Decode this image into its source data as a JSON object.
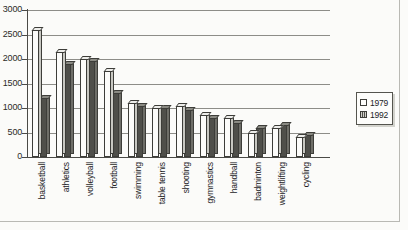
{
  "chart_data": {
    "type": "bar",
    "title": "",
    "xlabel": "",
    "ylabel": "",
    "ylim": [
      0,
      3000
    ],
    "ytick_values": [
      0,
      500,
      1000,
      1500,
      2000,
      2500,
      3000
    ],
    "ytick_labels": [
      "0",
      "500",
      "1000",
      "1500",
      "2000",
      "2500",
      "3000"
    ],
    "grid": true,
    "legend_position": "right",
    "style": "3d-grouped-bars",
    "categories": [
      "basketball",
      "athletics",
      "volleyball",
      "football",
      "swimming",
      "table tennis",
      "shooting",
      "gymnastics",
      "handball",
      "badminton",
      "weightlifting",
      "cycling"
    ],
    "series": [
      {
        "name": "1979",
        "color": "#fcfcfa",
        "values": [
          2600,
          2150,
          2000,
          1750,
          1100,
          1000,
          1050,
          850,
          800,
          500,
          600,
          400
        ]
      },
      {
        "name": "1992",
        "color": "#4f4f4a",
        "values": [
          1200,
          1900,
          1950,
          1300,
          1050,
          1000,
          950,
          800,
          700,
          600,
          650,
          450
        ]
      }
    ]
  },
  "legend": {
    "items": [
      {
        "label": "1979",
        "key": "y1979"
      },
      {
        "label": "1992",
        "key": "y1992"
      }
    ]
  },
  "colors": {
    "page_background": "#fbfbf9",
    "axis": "#4a4a46",
    "gridline": "#8d8d88",
    "series_1979": "#fcfcfa",
    "series_1992": "#4f4f4a"
  }
}
